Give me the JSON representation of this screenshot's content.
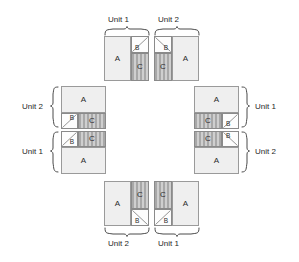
{
  "diagram": {
    "block_labels": {
      "a": "A",
      "b": "B",
      "c": "C"
    },
    "unit_labels": {
      "top_left": "Unit 1",
      "top_right": "Unit 2",
      "right_top": "Unit 1",
      "right_bottom": "Unit 2",
      "bottom_left": "Unit 2",
      "bottom_right": "Unit 1",
      "left_top": "Unit 2",
      "left_bottom": "Unit 1"
    },
    "colors": {
      "background": "#ffffff",
      "block_a_fill": "#efefef",
      "block_b_fill": "#fdfdfd",
      "block_c_fill": "#b4b4b4",
      "block_c_stripe": "#cfcfcf",
      "outline": "#8a8a8a",
      "brace": "#4a4a4a",
      "text": "#1f1f1f"
    },
    "groups": [
      {
        "name": "top-left-group",
        "unit": "Unit 1",
        "orientation": "vertical",
        "blocks": [
          "A",
          "B",
          "C"
        ]
      },
      {
        "name": "top-right-group",
        "unit": "Unit 2",
        "orientation": "vertical",
        "blocks": [
          "B",
          "C",
          "A"
        ]
      },
      {
        "name": "right-top-group",
        "unit": "Unit 1",
        "orientation": "horizontal",
        "blocks": [
          "A",
          "C",
          "B"
        ]
      },
      {
        "name": "right-bottom-group",
        "unit": "Unit 2",
        "orientation": "horizontal",
        "blocks": [
          "C",
          "B",
          "A"
        ]
      },
      {
        "name": "bottom-right-group",
        "unit": "Unit 1",
        "orientation": "vertical",
        "blocks": [
          "C",
          "B",
          "A"
        ]
      },
      {
        "name": "bottom-left-group",
        "unit": "Unit 2",
        "orientation": "vertical",
        "blocks": [
          "A",
          "C",
          "B"
        ]
      },
      {
        "name": "left-bottom-group",
        "unit": "Unit 1",
        "orientation": "horizontal",
        "blocks": [
          "B",
          "C",
          "A"
        ]
      },
      {
        "name": "left-top-group",
        "unit": "Unit 2",
        "orientation": "horizontal",
        "blocks": [
          "A",
          "B",
          "C"
        ]
      }
    ]
  }
}
